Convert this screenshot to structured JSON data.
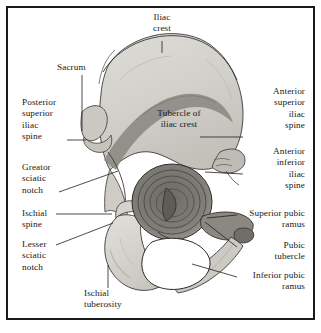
{
  "figure": {
    "frame_color": "#1a1a1a",
    "background_color": "#ffffff",
    "bone_fill_light": "#d9d7d2",
    "bone_fill_mid": "#c2bfb8",
    "bone_fill_dark": "#8d8a84",
    "bone_fill_darker": "#6f6d68",
    "outline_color": "#2b2b2b",
    "leader_color": "#1f1f1f",
    "foramen_color": "#ffffff"
  },
  "labels": [
    {
      "id": "iliac-crest",
      "text": "Iliac\ncrest",
      "align": "center",
      "position": "top"
    },
    {
      "id": "sacrum",
      "text": "Sacrum",
      "align": "left",
      "position": "upper-left"
    },
    {
      "id": "posterior-superior-iliac-spine",
      "text": "Posterior\nsuperior\niliac\nspine",
      "align": "left",
      "position": "left"
    },
    {
      "id": "greator-sciatic-notch",
      "text": "Greator\nsciatic\nnotch",
      "align": "left",
      "position": "left"
    },
    {
      "id": "ischial-spine",
      "text": "Ischial\nspine",
      "align": "left",
      "position": "left"
    },
    {
      "id": "lesser-sciatic-notch",
      "text": "Lesser\nsciatic\nnotch",
      "align": "left",
      "position": "lower-left"
    },
    {
      "id": "ischial-tuberosity",
      "text": "Ischial\ntuberosity",
      "align": "left",
      "position": "bottom"
    },
    {
      "id": "tubercle-of-iliac-crest",
      "text": "Tubercle of\niliac crest",
      "align": "center",
      "position": "center"
    },
    {
      "id": "anterior-superior-iliac-spine",
      "text": "Anterior\nsuperior\niliac\nspine",
      "align": "right",
      "position": "right"
    },
    {
      "id": "anterior-inferior-iliac-spine",
      "text": "Anterior\ninferior\niliac\nspine",
      "align": "right",
      "position": "right"
    },
    {
      "id": "superior-pubic-ramus",
      "text": "Superior pubic\nramus",
      "align": "right",
      "position": "right"
    },
    {
      "id": "pubic-tubercle",
      "text": "Pubic\ntubercle",
      "align": "right",
      "position": "right"
    },
    {
      "id": "inferior-pubic-ramus",
      "text": "Inferior pubic\nramus",
      "align": "right",
      "position": "lower-right"
    }
  ]
}
